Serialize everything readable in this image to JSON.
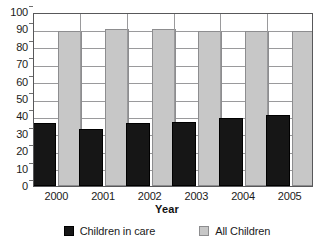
{
  "chart_data": {
    "type": "bar",
    "title": "",
    "xlabel": "Year",
    "ylabel": "",
    "categories": [
      "2000",
      "2001",
      "2002",
      "2003",
      "2004",
      "2005"
    ],
    "series": [
      {
        "name": "Children in care",
        "color": "#161616",
        "values": [
          36,
          33,
          36,
          37,
          39,
          41
        ]
      },
      {
        "name": "All Children",
        "color": "#c7c7c7",
        "values": [
          89,
          90,
          90,
          89,
          89,
          89
        ]
      }
    ],
    "ylim": [
      0,
      100
    ],
    "ytick_step": 10,
    "yticks": [
      "100",
      "90",
      "80",
      "70",
      "60",
      "50",
      "40",
      "30",
      "20",
      "10",
      "0"
    ],
    "grid": true,
    "legend_position": "bottom"
  },
  "legend": {
    "items": [
      {
        "label": "Children in care",
        "swatch": "dark"
      },
      {
        "label": "All Children",
        "swatch": "light"
      }
    ]
  },
  "axis": {
    "x_title": "Year"
  }
}
